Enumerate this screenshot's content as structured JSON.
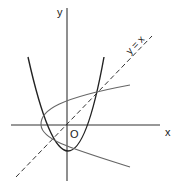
{
  "diagram": {
    "axes": {
      "x_label": "x",
      "y_label": "y",
      "origin_label": "O"
    },
    "line": {
      "label": "y = x",
      "style": "dashed"
    },
    "curves": [
      {
        "name": "upward parabola",
        "color": "#222222"
      },
      {
        "name": "sideways parabola (reflection in y = x)",
        "color": "#555555"
      }
    ],
    "colors": {
      "axis": "#333333",
      "curve_main": "#222222",
      "curve_reflected": "#666666",
      "line": "#333333"
    }
  }
}
